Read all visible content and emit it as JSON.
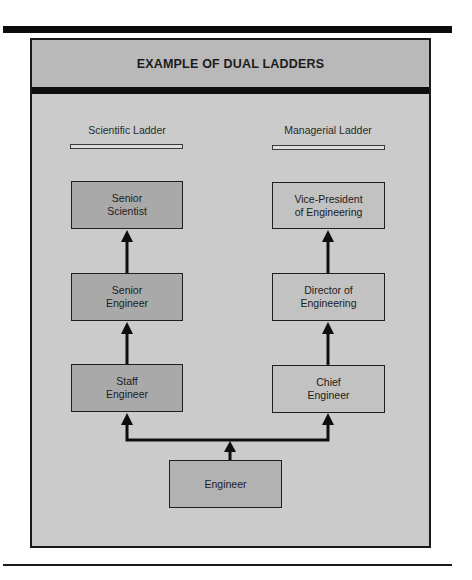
{
  "figure": {
    "title": "EXAMPLE OF DUAL LADDERS",
    "colors": {
      "frame_background": "#cbcbcb",
      "header_background": "#b9b9b9",
      "scientific_box": "#a9a9a9",
      "managerial_box": "#c2c2c2",
      "base_box": "#b2b2b2",
      "lines": "#0e0e0e"
    }
  },
  "ladders": {
    "scientific": {
      "label": "Scientific Ladder",
      "levels": [
        {
          "label": "Senior\nScientist"
        },
        {
          "label": "Senior\nEngineer"
        },
        {
          "label": "Staff\nEngineer"
        }
      ]
    },
    "managerial": {
      "label": "Managerial Ladder",
      "levels": [
        {
          "label": "Vice-President\nof Engineering"
        },
        {
          "label": "Director of\nEngineering"
        },
        {
          "label": "Chief\nEngineer"
        }
      ]
    }
  },
  "base": {
    "label": "Engineer"
  }
}
